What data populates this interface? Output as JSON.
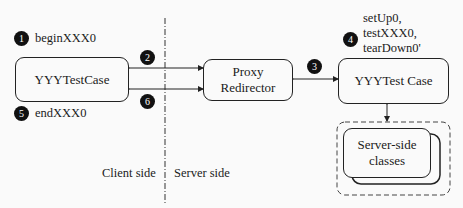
{
  "diagram": {
    "nodes": {
      "client_test_case": "YYYTestCase",
      "proxy_line1": "Proxy",
      "proxy_line2": "Redirector",
      "server_test_case": "YYYTest Case",
      "server_classes_line1": "Server-side",
      "server_classes_line2": "classes"
    },
    "steps": [
      {
        "num": "1",
        "label": "beginXXX0"
      },
      {
        "num": "2",
        "label": ""
      },
      {
        "num": "3",
        "label": ""
      },
      {
        "num": "4",
        "label_lines": [
          "setUp0,",
          "testXXX0,",
          "tearDown0'"
        ]
      },
      {
        "num": "5",
        "label": "endXXX0"
      },
      {
        "num": "6",
        "label": ""
      }
    ],
    "sides": {
      "client": "Client side",
      "server": "Server side"
    }
  }
}
